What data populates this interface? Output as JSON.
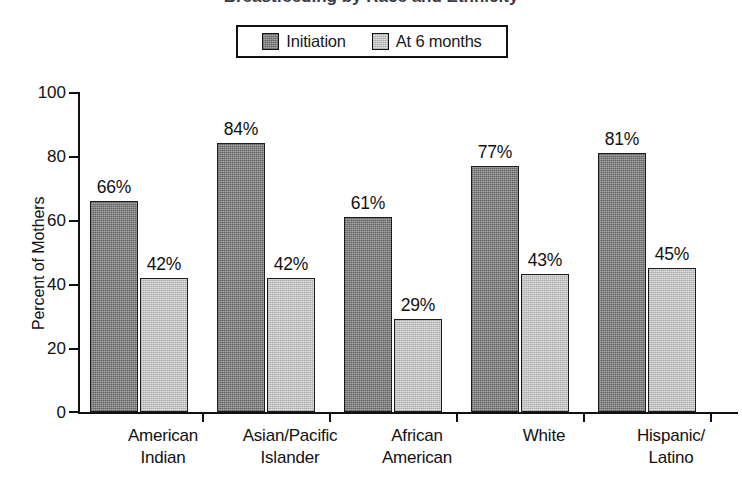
{
  "chart_title_cropped": "Breastfeeding by Race and Ethnicity",
  "legend": {
    "entries": [
      {
        "label": "Initiation",
        "swatch": "dark-gray-swatch",
        "color": "#8b8b8b"
      },
      {
        "label": "At 6 months",
        "swatch": "light-gray-swatch",
        "color": "#d2d2d2"
      }
    ]
  },
  "chart_data": {
    "type": "bar",
    "title": "Breastfeeding by Race and Ethnicity",
    "xlabel": "",
    "ylabel": "Percent of Mothers",
    "ylim": [
      0,
      100
    ],
    "yticks": [
      0,
      20,
      40,
      60,
      80,
      100
    ],
    "grid": false,
    "legend_position": "top-center",
    "categories": [
      "American Indian",
      "Asian/Pacific Islander",
      "African American",
      "White",
      "Hispanic/ Latino"
    ],
    "category_lines": [
      [
        "American",
        "Indian"
      ],
      [
        "Asian/Pacific",
        "Islander"
      ],
      [
        "African",
        "American"
      ],
      [
        "White",
        ""
      ],
      [
        "Hispanic/",
        "Latino"
      ]
    ],
    "series": [
      {
        "name": "Initiation",
        "color": "#8b8b8b",
        "values": [
          66,
          84,
          61,
          77,
          81
        ],
        "labels": [
          "66%",
          "84%",
          "61%",
          "77%",
          "81%"
        ]
      },
      {
        "name": "At 6 months",
        "color": "#d2d2d2",
        "values": [
          42,
          42,
          29,
          43,
          45
        ],
        "labels": [
          "42%",
          "42%",
          "29%",
          "43%",
          "45%"
        ]
      }
    ]
  },
  "axis": {
    "y_tick_labels": [
      "100",
      "80",
      "60",
      "40",
      "20",
      "0"
    ],
    "y_axis_title": "Percent of Mothers"
  }
}
